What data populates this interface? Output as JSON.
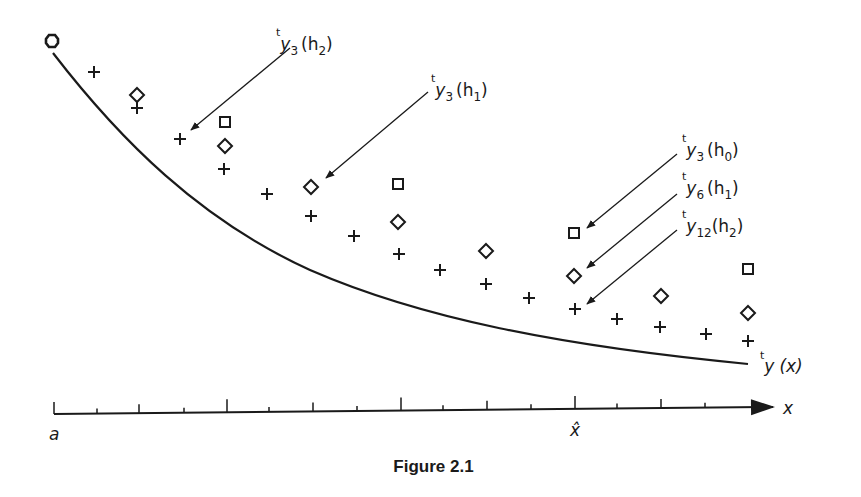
{
  "figure": {
    "caption": "Figure 2.1",
    "curve_label": {
      "pre": "t",
      "main": "y",
      "args": "(x)"
    },
    "axis": {
      "x_label": "x",
      "origin_label": "a",
      "marked_point_label": "x̂"
    },
    "annotations": [
      {
        "pre": "t",
        "main": "y",
        "sub": "3",
        "args_open": "(h",
        "args_sub": "2",
        "args_close": ")",
        "points_to": "plus"
      },
      {
        "pre": "t",
        "main": "y",
        "sub": "3",
        "args_open": "(h",
        "args_sub": "1",
        "args_close": ")",
        "points_to": "diamond"
      },
      {
        "pre": "t",
        "main": "y",
        "sub": "3",
        "args_open": "(h",
        "args_sub": "0",
        "args_close": ")",
        "points_to": "square"
      },
      {
        "pre": "t",
        "main": "y",
        "sub": "6",
        "args_open": "(h",
        "args_sub": "1",
        "args_close": ")",
        "points_to": "diamond"
      },
      {
        "pre": "t",
        "main": "y",
        "sub": "12",
        "args_open": "(h",
        "args_sub": "2",
        "args_close": ")",
        "points_to": "plus"
      }
    ],
    "series": [
      {
        "name": "step h0 (squares)",
        "marker": "square",
        "points": [
          [
            225,
            122
          ],
          [
            398,
            184
          ],
          [
            574,
            233
          ],
          [
            748,
            269
          ]
        ]
      },
      {
        "name": "step h1 (diamonds)",
        "marker": "diamond",
        "points": [
          [
            137,
            95
          ],
          [
            225,
            146
          ],
          [
            311,
            187
          ],
          [
            398,
            222
          ],
          [
            486,
            251
          ],
          [
            574,
            276
          ],
          [
            661,
            296
          ],
          [
            748,
            313
          ]
        ]
      },
      {
        "name": "step h2 (plus)",
        "marker": "plus",
        "points": [
          [
            94,
            72
          ],
          [
            137,
            108
          ],
          [
            180,
            139
          ],
          [
            224,
            169
          ],
          [
            267,
            194
          ],
          [
            311,
            216
          ],
          [
            354,
            236
          ],
          [
            399,
            254
          ],
          [
            440,
            270
          ],
          [
            486,
            284
          ],
          [
            529,
            298
          ],
          [
            575,
            309
          ],
          [
            617,
            319
          ],
          [
            660,
            327
          ],
          [
            706,
            334
          ],
          [
            748,
            341
          ]
        ]
      }
    ],
    "start_marker": [
      52,
      41
    ],
    "ticks": [
      {
        "x": 54,
        "h": 12
      },
      {
        "x": 97,
        "h": 5
      },
      {
        "x": 139,
        "h": 9
      },
      {
        "x": 184,
        "h": 5
      },
      {
        "x": 227,
        "h": 13
      },
      {
        "x": 269,
        "h": 5
      },
      {
        "x": 313,
        "h": 9
      },
      {
        "x": 357,
        "h": 5
      },
      {
        "x": 401,
        "h": 13
      },
      {
        "x": 443,
        "h": 5
      },
      {
        "x": 487,
        "h": 9
      },
      {
        "x": 531,
        "h": 5
      },
      {
        "x": 575,
        "h": 13
      },
      {
        "x": 617,
        "h": 5
      },
      {
        "x": 661,
        "h": 9
      },
      {
        "x": 705,
        "h": 5
      }
    ]
  }
}
